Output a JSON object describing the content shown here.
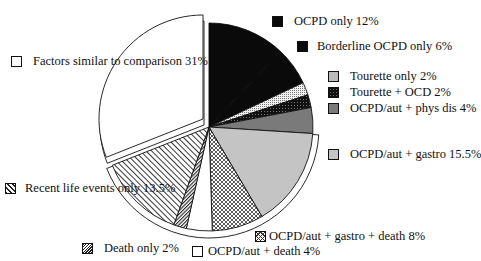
{
  "chart_data": {
    "type": "pie",
    "title": "",
    "start_angle_deg": 0,
    "direction": "clockwise",
    "slices": [
      {
        "label": "OCPD only",
        "value": 12,
        "display": "OCPD only 12%",
        "fill": "#0a0a0a",
        "pattern": "solid-black"
      },
      {
        "label": "Borderline OCPD only",
        "value": 6,
        "display": "Borderline OCPD only 6%",
        "fill": "#0a0a0a",
        "pattern": "solid-black"
      },
      {
        "label": "Tourette only",
        "value": 2,
        "display": "Tourette only 2%",
        "fill": "#e8e8e8",
        "pattern": "light-dots"
      },
      {
        "label": "Tourette + OCD",
        "value": 2,
        "display": "Tourette + OCD 2%",
        "fill": "#111111",
        "pattern": "dark-dots"
      },
      {
        "label": "OCPD/aut + phys dis",
        "value": 4,
        "display": "OCPD/aut + phys dis 4%",
        "fill": "#7a7a7a",
        "pattern": "dark-gray"
      },
      {
        "label": "OCPD/aut + gastro",
        "value": 15.5,
        "display": "OCPD/aut + gastro 15.5%",
        "fill": "#c4c4c4",
        "pattern": "light-gray"
      },
      {
        "label": "OCPD/aut + gastro + death",
        "value": 8,
        "display": "OCPD/aut + gastro + death 8%",
        "fill": "#ffffff",
        "pattern": "crosshatch"
      },
      {
        "label": "OCPD/aut + death",
        "value": 4,
        "display": "OCPD/aut + death 4%",
        "fill": "#ffffff",
        "pattern": "white"
      },
      {
        "label": "Death only",
        "value": 2,
        "display": "Death only 2%",
        "fill": "#ffffff",
        "pattern": "dense-hatch"
      },
      {
        "label": "Recent life events only",
        "value": 13.5,
        "display": "Recent life events only 13.5%",
        "fill": "#ffffff",
        "pattern": "diagonal-hatch"
      },
      {
        "label": "Factors similar to comparison",
        "value": 31,
        "display": "Factors similar to comparison 31%",
        "fill": "#ffffff",
        "pattern": "white",
        "exploded": true
      }
    ],
    "legend_position": "around"
  },
  "legend": {
    "ocpd_only": "OCPD only 12%",
    "borderline": "Borderline OCPD only 6%",
    "tourette_only": "Tourette only 2%",
    "tourette_ocd": "Tourette + OCD 2%",
    "phys_dis": "OCPD/aut + phys dis 4%",
    "gastro": "OCPD/aut + gastro 15.5%",
    "gastro_death": "OCPD/aut + gastro + death 8%",
    "aut_death": "OCPD/aut + death 4%",
    "death_only": "Death only 2%",
    "recent_life": "Recent life events only 13.5%",
    "factors_similar": "Factors similar to comparison 31%"
  }
}
